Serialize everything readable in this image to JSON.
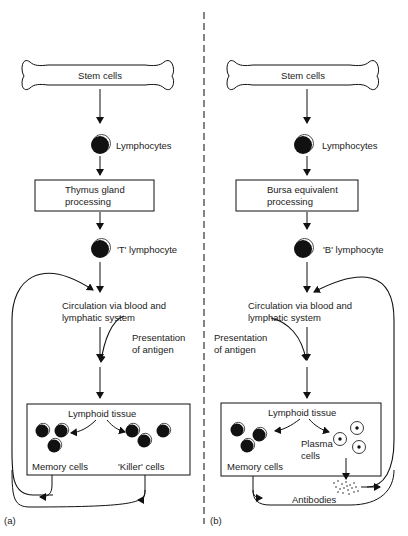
{
  "panel_a": {
    "tag": "(a)",
    "stem": "Stem cells",
    "lymphocytes": "Lymphocytes",
    "processing_line1": "Thymus gland",
    "processing_line2": "processing",
    "lymphocyte_type": "'T' lymphocyte",
    "circulation_line1": "Circulation via blood and",
    "circulation_line2": "lymphatic system",
    "presentation_line1": "Presentation",
    "presentation_line2": "of antigen",
    "tissue": "Lymphoid tissue",
    "memory": "Memory cells",
    "effector": "'Killer' cells"
  },
  "panel_b": {
    "tag": "(b)",
    "stem": "Stem cells",
    "lymphocytes": "Lymphocytes",
    "processing_line1": "Bursa equivalent",
    "processing_line2": "processing",
    "lymphocyte_type": "'B' lymphocyte",
    "circulation_line1": "Circulation via blood and",
    "circulation_line2": "lymphatic system",
    "presentation_line1": "Presentation",
    "presentation_line2": "of antigen",
    "tissue": "Lymphoid tissue",
    "memory": "Memory cells",
    "plasma_line1": "Plasma",
    "plasma_line2": "cells",
    "antibodies": "Antibodies"
  }
}
